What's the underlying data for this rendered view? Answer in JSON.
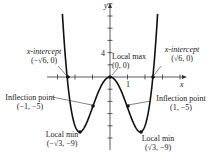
{
  "chart_data": {
    "type": "line",
    "function": "x^4 - 6x^2",
    "xlabel": "x",
    "ylabel": "y",
    "x_tick_label": "1",
    "y_tick_label": "4",
    "xlim": [
      -3.5,
      4.2
    ],
    "ylim": [
      -10,
      13
    ],
    "grid": false,
    "points": [
      {
        "name": "x-intercept",
        "coords": "(−√6, 0)",
        "x": -2.449,
        "y": 0
      },
      {
        "name": "Local max",
        "coords": "(0, 0)",
        "x": 0,
        "y": 0
      },
      {
        "name": "x-intercept",
        "coords": "(√6, 0)",
        "x": 2.449,
        "y": 0
      },
      {
        "name": "Inflection point",
        "coords": "(−1, −5)",
        "x": -1,
        "y": -5
      },
      {
        "name": "Inflection point",
        "coords": "(1, −5)",
        "x": 1,
        "y": -5
      },
      {
        "name": "Local min",
        "coords": "(−√3, −9)",
        "x": -1.732,
        "y": -9
      },
      {
        "name": "Local min",
        "coords": "(√3, −9)",
        "x": 1.732,
        "y": -9
      }
    ]
  },
  "labels": {
    "xint_left_title": "x-intercept",
    "xint_left_coords": "(−√6, 0)",
    "xint_right_title": "x-intercept",
    "xint_right_coords": "(√6, 0)",
    "localmax_title": "Local max",
    "localmax_coords": "(0, 0)",
    "infl_left_title": "Inflection point",
    "infl_left_coords": "(−1, −5)",
    "infl_right_title": "Inflection point",
    "infl_right_coords": "(1, −5)",
    "min_left_title": "Local min",
    "min_left_coords": "(−√3, −9)",
    "min_right_title": "Local min",
    "min_right_coords": "(√3, −9)",
    "x_axis": "x",
    "y_axis": "y",
    "x_tick": "1",
    "y_tick": "4"
  }
}
